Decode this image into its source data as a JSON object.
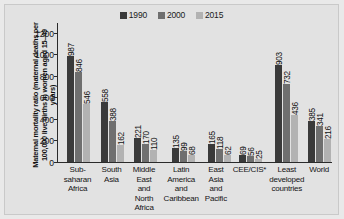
{
  "chart_data": {
    "type": "bar",
    "title": "",
    "xlabel": "",
    "ylabel": "Maternal mortality ratio (maternal deaths per 100,000 live births in women aged 15–49 years)",
    "ylim": [
      0,
      1300
    ],
    "yticks": [
      0,
      200,
      400,
      600,
      800,
      1000,
      1200
    ],
    "ytick_labels": [
      "0",
      "200",
      "400",
      "600",
      "800",
      "1000",
      "1200"
    ],
    "grid": false,
    "legend_position": "top-center",
    "categories": [
      "Sub-saharan Africa",
      "South Asia",
      "Middle East and North Africa",
      "Latin America and Caribbean",
      "East Asia and Pacific",
      "CEE/CIS*",
      "Least developed countries",
      "World"
    ],
    "category_lines": [
      [
        "Sub-",
        "saharan",
        "Africa"
      ],
      [
        "South",
        "Asia"
      ],
      [
        "Middle",
        "East",
        "and",
        "North",
        "Africa"
      ],
      [
        "Latin",
        "America",
        "and",
        "Caribbean"
      ],
      [
        "East",
        "Asia",
        "and",
        "Pacific"
      ],
      [
        "CEE/CIS*"
      ],
      [
        "Least",
        "developed",
        "countries"
      ],
      [
        "World"
      ]
    ],
    "series": [
      {
        "name": "1990",
        "color": "#3a3a3a",
        "values": [
          987,
          558,
          221,
          135,
          165,
          69,
          903,
          385
        ]
      },
      {
        "name": "2000",
        "color": "#6f6f6f",
        "values": [
          846,
          388,
          170,
          99,
          118,
          56,
          732,
          341
        ]
      },
      {
        "name": "2015",
        "color": "#b2b2b2",
        "values": [
          546,
          162,
          110,
          68,
          62,
          25,
          436,
          216
        ]
      }
    ]
  },
  "legend": {
    "items": [
      {
        "label": "1990",
        "color": "#3a3a3a"
      },
      {
        "label": "2000",
        "color": "#6f6f6f"
      },
      {
        "label": "2015",
        "color": "#b2b2b2"
      }
    ]
  }
}
